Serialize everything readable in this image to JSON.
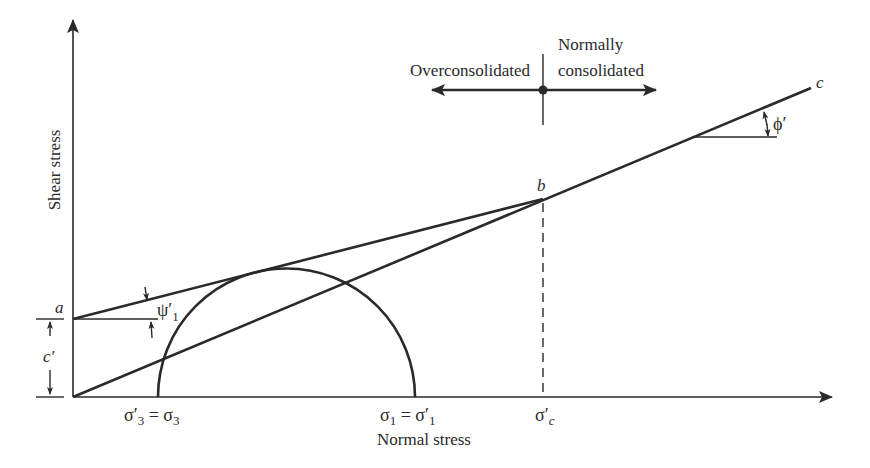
{
  "diagram": {
    "axes": {
      "x_label": "Normal stress",
      "y_label": "Shear stress"
    },
    "regions": {
      "left_label": "Overconsolidated",
      "right_label_line1": "Normally",
      "right_label_line2": "consolidated"
    },
    "points": {
      "a": "a",
      "b": "b",
      "c": "c"
    },
    "angles": {
      "psi": "ψ′",
      "psi_sub": "1",
      "phi": "ϕ′"
    },
    "intercept": {
      "cohesion": "c′"
    },
    "stress_labels": {
      "sigma3_lhs": "σ′",
      "sigma3_lhs_sub": "3",
      "sigma3_eq": " = σ",
      "sigma3_rhs_sub": "3",
      "sigma1_lhs": "σ",
      "sigma1_lhs_sub": "1",
      "sigma1_eq": " = σ′",
      "sigma1_rhs_sub": "1",
      "sigmac": "σ′",
      "sigmac_sub": "c"
    },
    "colors": {
      "line": "#2a2a2a",
      "background": "#ffffff"
    }
  }
}
